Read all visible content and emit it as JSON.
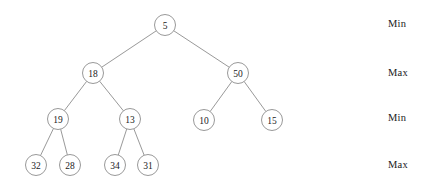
{
  "diagram": {
    "background_color": "#ffffff",
    "node_stroke_color": "#8d8d8d",
    "edge_color": "#8d8d8d",
    "text_color": "#1a1a1a",
    "node_radius": 10.5
  },
  "nodes": [
    {
      "id": "n0",
      "value": "5",
      "x": 165,
      "y": 25,
      "level": 0
    },
    {
      "id": "n1",
      "value": "18",
      "x": 93,
      "y": 73,
      "level": 1
    },
    {
      "id": "n2",
      "value": "50",
      "x": 238,
      "y": 73,
      "level": 1
    },
    {
      "id": "n3",
      "value": "19",
      "x": 58,
      "y": 119,
      "level": 2
    },
    {
      "id": "n4",
      "value": "13",
      "x": 130,
      "y": 119,
      "level": 2
    },
    {
      "id": "n5",
      "value": "10",
      "x": 204,
      "y": 120,
      "level": 2
    },
    {
      "id": "n6",
      "value": "15",
      "x": 272,
      "y": 120,
      "level": 2
    },
    {
      "id": "n7",
      "value": "32",
      "x": 36,
      "y": 165,
      "level": 3
    },
    {
      "id": "n8",
      "value": "28",
      "x": 70,
      "y": 165,
      "level": 3
    },
    {
      "id": "n9",
      "value": "34",
      "x": 115,
      "y": 165,
      "level": 3
    },
    {
      "id": "n10",
      "value": "31",
      "x": 148,
      "y": 165,
      "level": 3
    }
  ],
  "edges": [
    {
      "from": "n0",
      "to": "n1"
    },
    {
      "from": "n0",
      "to": "n2"
    },
    {
      "from": "n1",
      "to": "n3"
    },
    {
      "from": "n1",
      "to": "n4"
    },
    {
      "from": "n2",
      "to": "n5"
    },
    {
      "from": "n2",
      "to": "n6"
    },
    {
      "from": "n3",
      "to": "n7"
    },
    {
      "from": "n3",
      "to": "n8"
    },
    {
      "from": "n4",
      "to": "n9"
    },
    {
      "from": "n4",
      "to": "n10"
    }
  ],
  "level_labels": [
    {
      "text": "Min",
      "x": 388,
      "y": 25
    },
    {
      "text": "Max",
      "x": 388,
      "y": 74
    },
    {
      "text": "Min",
      "x": 388,
      "y": 119
    },
    {
      "text": "Max",
      "x": 388,
      "y": 166
    }
  ]
}
